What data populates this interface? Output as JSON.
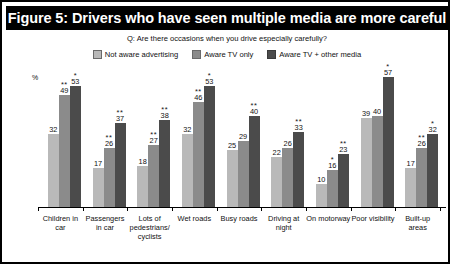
{
  "title": "Figure 5: Drivers who have seen multiple media are more careful",
  "question": "Q: Are there occasions when you drive especially carefully?",
  "legend": [
    {
      "label": "Not aware advertising",
      "color": "#b9b9b9"
    },
    {
      "label": "Aware TV only",
      "color": "#8b8b8b"
    },
    {
      "label": "Aware TV + other media",
      "color": "#4b4b4b"
    }
  ],
  "chart_data": {
    "type": "bar",
    "title": "Figure 5: Drivers who have seen multiple media are more careful",
    "subtitle": "Q: Are there occasions when you drive especially carefully?",
    "xlabel": "",
    "ylabel": "%",
    "ylim": [
      0,
      60
    ],
    "grid": false,
    "legend_position": "top",
    "categories": [
      "Children in car",
      "Passengers in car",
      "Lots of pedestrians/ cyclists",
      "Wet roads",
      "Busy roads",
      "Driving at night",
      "On motorway",
      "Poor visibility",
      "Built-up areas"
    ],
    "series": [
      {
        "name": "Not aware advertising",
        "color": "#b9b9b9",
        "values": [
          32,
          17,
          18,
          32,
          25,
          22,
          10,
          39,
          17
        ],
        "significance": [
          "",
          "",
          "",
          "",
          "",
          "",
          "",
          "",
          ""
        ]
      },
      {
        "name": "Aware TV only",
        "color": "#8b8b8b",
        "values": [
          49,
          26,
          27,
          46,
          29,
          26,
          16,
          40,
          26
        ],
        "significance": [
          "**",
          "**",
          "**",
          "**",
          "",
          "",
          "*",
          "",
          "**"
        ]
      },
      {
        "name": "Aware TV + other media",
        "color": "#4b4b4b",
        "values": [
          53,
          37,
          38,
          53,
          40,
          33,
          23,
          57,
          32
        ],
        "significance": [
          "*",
          "**",
          "**",
          "*",
          "**",
          "**",
          "**",
          "*",
          "*"
        ]
      }
    ]
  }
}
